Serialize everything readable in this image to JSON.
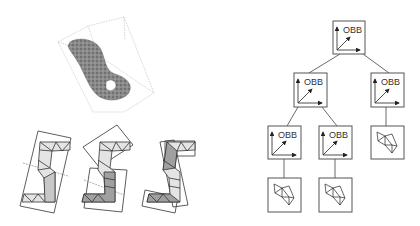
{
  "figure": {
    "left_panel": {
      "top": {
        "description": "3D mesh enclosed in oriented bounding box"
      },
      "bottom": {
        "description": "2D triangulated S-shaped polygon with OBB subdivisions",
        "count": 3
      }
    },
    "tree": {
      "node_label": "OBB",
      "nodes": [
        {
          "id": "root",
          "label": "OBB"
        },
        {
          "id": "l2-left",
          "label": "OBB"
        },
        {
          "id": "l2-right",
          "label": "OBB"
        },
        {
          "id": "l3-left",
          "label": "OBB"
        },
        {
          "id": "l3-mid",
          "label": "OBB"
        },
        {
          "id": "leaf-right",
          "label": ""
        },
        {
          "id": "leaf-left",
          "label": ""
        },
        {
          "id": "leaf-mid",
          "label": ""
        }
      ]
    },
    "colors": {
      "line": "#444444",
      "box": "#555555",
      "fill_light": "#d8d8d8",
      "fill_dark": "#9a9a9a"
    }
  }
}
